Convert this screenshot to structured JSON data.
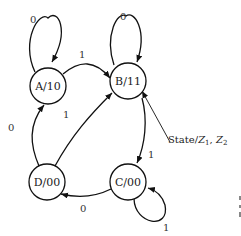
{
  "diagram": {
    "type": "state-diagram (Moore machine)",
    "states": [
      {
        "id": "A",
        "name": "A",
        "output": "10",
        "label": "A/10"
      },
      {
        "id": "B",
        "name": "B",
        "output": "11",
        "label": "B/11"
      },
      {
        "id": "C",
        "name": "C",
        "output": "00",
        "label": "C/00"
      },
      {
        "id": "D",
        "name": "D",
        "output": "00",
        "label": "D/00"
      }
    ],
    "transitions": [
      {
        "from": "A",
        "to": "A",
        "input": "0"
      },
      {
        "from": "A",
        "to": "B",
        "input": "1"
      },
      {
        "from": "B",
        "to": "B",
        "input": "0"
      },
      {
        "from": "B",
        "to": "C",
        "input": "1"
      },
      {
        "from": "C",
        "to": "C",
        "input": "1"
      },
      {
        "from": "C",
        "to": "D",
        "input": "0"
      },
      {
        "from": "D",
        "to": "A",
        "input": "0"
      },
      {
        "from": "D",
        "to": "B",
        "input": "1"
      }
    ],
    "legend": {
      "state": "State/",
      "z1": "Z",
      "z1_sub": "1",
      "sep": ", ",
      "z2": "Z",
      "z2_sub": "2"
    },
    "labels": {
      "a_self": "0",
      "a_to_b": "1",
      "b_self": "0",
      "b_to_c": "1",
      "c_self": "1",
      "c_to_d": "0",
      "d_to_a": "0",
      "d_to_b": "1"
    }
  }
}
